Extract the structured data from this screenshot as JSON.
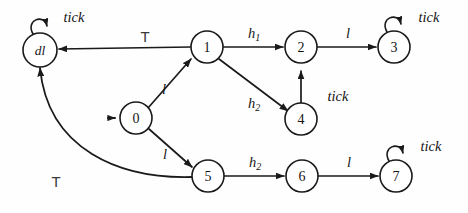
{
  "figure": {
    "kind": "state-transition-diagram",
    "width": 468,
    "height": 213,
    "background_color": "#fefefe",
    "ink_color": "#1a1a1a"
  },
  "nodes": [
    {
      "id": "dl",
      "label": "dl",
      "cx": 40,
      "cy": 50,
      "r": 17,
      "italic": true,
      "initial": false
    },
    {
      "id": "n1",
      "label": "1",
      "cx": 207,
      "cy": 47,
      "r": 16,
      "italic": false,
      "initial": false
    },
    {
      "id": "n2",
      "label": "2",
      "cx": 301,
      "cy": 47,
      "r": 16,
      "italic": false,
      "initial": false
    },
    {
      "id": "n3",
      "label": "3",
      "cx": 394,
      "cy": 47,
      "r": 16,
      "italic": false,
      "initial": false
    },
    {
      "id": "n0",
      "label": "0",
      "cx": 136,
      "cy": 118,
      "r": 16,
      "italic": false,
      "initial": true
    },
    {
      "id": "n4",
      "label": "4",
      "cx": 301,
      "cy": 119,
      "r": 16,
      "italic": false,
      "initial": false
    },
    {
      "id": "n5",
      "label": "5",
      "cx": 208,
      "cy": 176,
      "r": 16,
      "italic": false,
      "initial": false
    },
    {
      "id": "n6",
      "label": "6",
      "cx": 302,
      "cy": 176,
      "r": 16,
      "italic": false,
      "initial": false
    },
    {
      "id": "n7",
      "label": "7",
      "cx": 396,
      "cy": 176,
      "r": 16,
      "italic": false,
      "initial": false
    }
  ],
  "self_loops": [
    {
      "id": "loop-dl",
      "node": "dl",
      "label": "tick",
      "label_x": 74,
      "label_y": 17
    },
    {
      "id": "loop-n3",
      "node": "n3",
      "label": "tick",
      "label_x": 429,
      "label_y": 17
    },
    {
      "id": "loop-n7",
      "node": "n7",
      "label": "tick",
      "label_x": 431,
      "label_y": 146
    }
  ],
  "edges": [
    {
      "id": "e-1-dl",
      "from": "n1",
      "to": "dl",
      "label": "T",
      "label_style": "top",
      "label_x": 145,
      "label_y": 36
    },
    {
      "id": "e-1-2",
      "from": "n1",
      "to": "n2",
      "label": "h",
      "sub": "1",
      "label_x": 254,
      "label_y": 33
    },
    {
      "id": "e-2-3",
      "from": "n2",
      "to": "n3",
      "label": "l",
      "sub": "",
      "label_x": 348,
      "label_y": 33
    },
    {
      "id": "e-0-1",
      "from": "n0",
      "to": "n1",
      "label": "l",
      "sub": "",
      "label_x": 164,
      "label_y": 89
    },
    {
      "id": "e-1-4",
      "from": "n1",
      "to": "n4",
      "label": "h",
      "sub": "2",
      "label_x": 254,
      "label_y": 103
    },
    {
      "id": "e-4-2",
      "from": "n4",
      "to": "n2",
      "label": "tick",
      "sub": "",
      "label_x": 338,
      "label_y": 96
    },
    {
      "id": "e-0-5",
      "from": "n0",
      "to": "n5",
      "label": "l",
      "sub": "",
      "label_x": 165,
      "label_y": 154
    },
    {
      "id": "e-5-6",
      "from": "n5",
      "to": "n6",
      "label": "h",
      "sub": "2",
      "label_x": 255,
      "label_y": 162
    },
    {
      "id": "e-6-7",
      "from": "n6",
      "to": "n7",
      "label": "l",
      "sub": "",
      "label_x": 349,
      "label_y": 162
    },
    {
      "id": "e-5-dl",
      "from": "n5",
      "to": "dl",
      "label": "T",
      "label_style": "top",
      "label_x": 56,
      "label_y": 181
    }
  ]
}
